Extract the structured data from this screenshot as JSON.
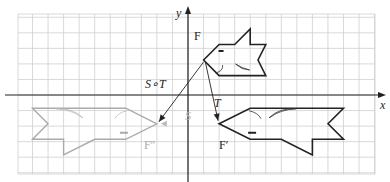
{
  "axes": {
    "x_label": "x",
    "y_label": "y"
  },
  "grid": {
    "x_range": [
      -11,
      12
    ],
    "y_range": [
      -5,
      5
    ]
  },
  "figures": {
    "F": {
      "label": "F",
      "color": "#222222",
      "points": [
        [
          1,
          2.25
        ],
        [
          2,
          3.25
        ],
        [
          3,
          3.25
        ],
        [
          4,
          4.25
        ],
        [
          4,
          3.25
        ],
        [
          5,
          3.25
        ],
        [
          4.5,
          2.25
        ],
        [
          5,
          1.25
        ],
        [
          2,
          1.25
        ]
      ]
    },
    "F_prime": {
      "label": "F′",
      "color": "#222222",
      "points": [
        [
          2,
          -1.85
        ],
        [
          4,
          -0.85
        ],
        [
          10,
          -0.85
        ],
        [
          9,
          -1.85
        ],
        [
          10,
          -2.85
        ],
        [
          8,
          -2.85
        ],
        [
          8,
          -3.85
        ],
        [
          6,
          -2.85
        ],
        [
          4,
          -2.85
        ]
      ]
    },
    "F_double_prime": {
      "label": "F″",
      "color": "#aaaaaa",
      "points": [
        [
          -2,
          -1.85
        ],
        [
          -4,
          -0.85
        ],
        [
          -10,
          -0.85
        ],
        [
          -9,
          -1.85
        ],
        [
          -10,
          -2.85
        ],
        [
          -8,
          -2.85
        ],
        [
          -8,
          -3.85
        ],
        [
          -6,
          -2.85
        ],
        [
          -4,
          -2.85
        ]
      ]
    }
  },
  "transformations": {
    "T": {
      "label": "T"
    },
    "S": {
      "label": "S"
    },
    "S_o_T": {
      "label": "S∘T"
    }
  }
}
